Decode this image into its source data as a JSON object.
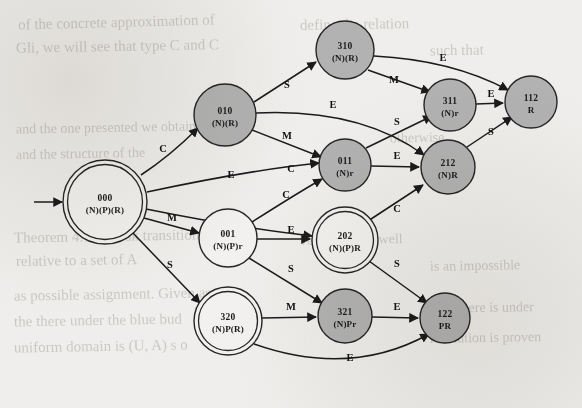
{
  "figure": {
    "kind": "state-transition-diagram",
    "width": 582,
    "height": 408,
    "background_color": "#efeeec",
    "node_fill_accepting_like": "#b2b2b2",
    "node_fill_plain": "#f2f1ef",
    "stroke_color": "#262626"
  },
  "nodes": [
    {
      "id": "000",
      "code": "000",
      "attrs": "(N)(P)(R)",
      "x": 105,
      "y": 202,
      "r": 42,
      "style": "double-white"
    },
    {
      "id": "010",
      "code": "010",
      "attrs": "(N)(R)",
      "x": 225,
      "y": 115,
      "r": 31,
      "style": "single-gray"
    },
    {
      "id": "001",
      "code": "001",
      "attrs": "(N)(P)r",
      "x": 228,
      "y": 238,
      "r": 29,
      "style": "single-white"
    },
    {
      "id": "320",
      "code": "320",
      "attrs": "(N)P(R)",
      "x": 228,
      "y": 321,
      "r": 34,
      "style": "double-white"
    },
    {
      "id": "310",
      "code": "310",
      "attrs": "(N)(R)",
      "x": 345,
      "y": 50,
      "r": 29,
      "style": "single-gray"
    },
    {
      "id": "011",
      "code": "011",
      "attrs": "(N)r",
      "x": 345,
      "y": 165,
      "r": 26,
      "style": "single-gray"
    },
    {
      "id": "202",
      "code": "202",
      "attrs": "(N)(P)R",
      "x": 345,
      "y": 240,
      "r": 33,
      "style": "double-white"
    },
    {
      "id": "321",
      "code": "321",
      "attrs": "(N)Pr",
      "x": 345,
      "y": 316,
      "r": 27,
      "style": "single-gray"
    },
    {
      "id": "311",
      "code": "311",
      "attrs": "(N)r",
      "x": 450,
      "y": 105,
      "r": 26,
      "style": "single-gray"
    },
    {
      "id": "212",
      "code": "212",
      "attrs": "(N)R",
      "x": 448,
      "y": 167,
      "r": 27,
      "style": "single-gray"
    },
    {
      "id": "122",
      "code": "122",
      "attrs": "PR",
      "x": 445,
      "y": 318,
      "r": 25,
      "style": "single-gray"
    },
    {
      "id": "112",
      "code": "112",
      "attrs": "R",
      "x": 531,
      "y": 102,
      "r": 26,
      "style": "single-gray"
    }
  ],
  "start_arrow": {
    "from_x": 34,
    "from_y": 202,
    "to_x": 62,
    "to_y": 202
  },
  "edges": [
    {
      "from": "000",
      "to": "010",
      "label": "C",
      "lx": 163,
      "ly": 152,
      "path": "M 141 175 Q 170 156 198 128"
    },
    {
      "from": "000",
      "to": "011",
      "label": "E",
      "lx": 231,
      "ly": 178,
      "path": "M 147 192 Q 250 170 319 163"
    },
    {
      "from": "000",
      "to": "202",
      "label": "C",
      "lx": 286,
      "ly": 198,
      "path": "M 146 209 Q 240 228 312 236"
    },
    {
      "from": "000",
      "to": "001",
      "label": "M",
      "lx": 172,
      "ly": 221,
      "path": "M 144 218 L 199 233"
    },
    {
      "from": "000",
      "to": "320",
      "label": "S",
      "lx": 170,
      "ly": 268,
      "path": "M 133 233 L 200 303"
    },
    {
      "from": "010",
      "to": "310",
      "label": "S",
      "lx": 287,
      "ly": 88,
      "path": "M 254 102 L 316 62"
    },
    {
      "from": "010",
      "to": "212",
      "label": "E",
      "lx": 333,
      "ly": 108,
      "path": "M 256 113 Q 360 108 424 155"
    },
    {
      "from": "010",
      "to": "011",
      "label": "M",
      "lx": 287,
      "ly": 139,
      "path": "M 252 130 L 321 157"
    },
    {
      "from": "310",
      "to": "112",
      "label": "E",
      "lx": 443,
      "ly": 61,
      "path": "M 374 56 Q 452 60 508 90"
    },
    {
      "from": "310",
      "to": "311",
      "label": "M",
      "lx": 394,
      "ly": 83,
      "path": "M 368 70 L 430 92"
    },
    {
      "from": "011",
      "to": "311",
      "label": "S",
      "lx": 397,
      "ly": 125,
      "path": "M 366 148 L 432 116"
    },
    {
      "from": "011",
      "to": "212",
      "label": "E",
      "lx": 397,
      "ly": 159,
      "path": "M 371 166 L 419 167"
    },
    {
      "from": "001",
      "to": "011",
      "label": "C",
      "lx": 291,
      "ly": 172,
      "path": "M 252 222 Q 296 194 322 179"
    },
    {
      "from": "001",
      "to": "202",
      "label": "E",
      "lx": 291,
      "ly": 233,
      "path": "M 257 239 L 310 239"
    },
    {
      "from": "001",
      "to": "321",
      "label": "S",
      "lx": 291,
      "ly": 272,
      "path": "M 249 258 L 322 303"
    },
    {
      "from": "202",
      "to": "212",
      "label": "C",
      "lx": 397,
      "ly": 212,
      "path": "M 368 221 L 423 185"
    },
    {
      "from": "202",
      "to": "122",
      "label": "S",
      "lx": 397,
      "ly": 267,
      "path": "M 369 261 L 427 303"
    },
    {
      "from": "320",
      "to": "321",
      "label": "M",
      "lx": 291,
      "ly": 310,
      "path": "M 262 318 L 316 317"
    },
    {
      "from": "320",
      "to": "122",
      "label": "E",
      "lx": 350,
      "ly": 361,
      "path": "M 254 344 Q 350 378 429 334"
    },
    {
      "from": "321",
      "to": "122",
      "label": "E",
      "lx": 397,
      "ly": 310,
      "path": "M 372 317 L 418 318"
    },
    {
      "from": "212",
      "to": "112",
      "label": "S",
      "lx": 491,
      "ly": 135,
      "path": "M 467 147 L 512 117"
    },
    {
      "from": "311",
      "to": "112",
      "label": "E",
      "lx": 491,
      "ly": 97,
      "path": "M 476 104 L 503 103"
    }
  ],
  "background_text": [
    {
      "text": "of the concrete approximation of",
      "x": 18,
      "y": 14,
      "size": 15,
      "rot": -1.5
    },
    {
      "text": "Gli, we will see that type C and C",
      "x": 16,
      "y": 38,
      "size": 15,
      "rot": -1
    },
    {
      "text": "define the relation",
      "x": 300,
      "y": 16,
      "size": 15,
      "rot": -1
    },
    {
      "text": "such that",
      "x": 430,
      "y": 42,
      "size": 15,
      "rot": -1
    },
    {
      "text": "and the one presented  we obtain",
      "x": 16,
      "y": 120,
      "size": 14,
      "rot": -1
    },
    {
      "text": "and the structure of the",
      "x": 16,
      "y": 146,
      "size": 14,
      "rot": -1
    },
    {
      "text": "otherwise",
      "x": 390,
      "y": 130,
      "size": 14,
      "rot": -1
    },
    {
      "text": "Theorem 4.1 A weak transition",
      "x": 14,
      "y": 228,
      "size": 15,
      "rot": -1
    },
    {
      "text": "relative to a set of A",
      "x": 16,
      "y": 252,
      "size": 15,
      "rot": -1
    },
    {
      "text": "as possible assignment. Given as",
      "x": 14,
      "y": 286,
      "size": 15,
      "rot": -1
    },
    {
      "text": "the there under the blue bud",
      "x": 14,
      "y": 312,
      "size": 15,
      "rot": -1
    },
    {
      "text": "uniform domain is (U, A) s o",
      "x": 14,
      "y": 338,
      "size": 15,
      "rot": -1
    },
    {
      "text": "version holds well",
      "x": 300,
      "y": 232,
      "size": 14,
      "rot": -1
    },
    {
      "text": "is an impossible",
      "x": 430,
      "y": 258,
      "size": 14,
      "rot": -1
    },
    {
      "text": "bute there is under",
      "x": 430,
      "y": 300,
      "size": 14,
      "rot": -1
    },
    {
      "text": "resolution is proven",
      "x": 430,
      "y": 330,
      "size": 14,
      "rot": -1
    }
  ]
}
